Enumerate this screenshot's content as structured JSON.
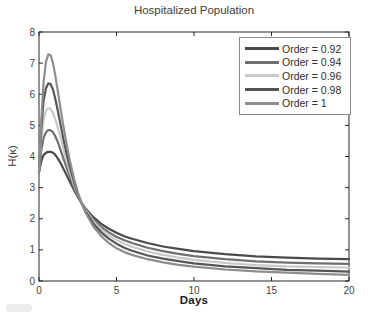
{
  "figure": {
    "background": "#ffffff",
    "axis_color": "#262626",
    "tick_label_color": "#454545"
  },
  "legend": {
    "border_color": "#8a8a8a",
    "background": "#ffffff",
    "position": "top-right"
  },
  "artifacts": {
    "bottom_left_smudge_color": "#dcdcdc"
  },
  "chart_data": {
    "type": "line",
    "title": "Hospitalized Population",
    "xlabel": "Days",
    "ylabel": "H(κ)",
    "xlim": [
      0,
      20
    ],
    "ylim": [
      0,
      8
    ],
    "xticks": [
      0,
      5,
      10,
      15,
      20
    ],
    "yticks": [
      0,
      1,
      2,
      3,
      4,
      5,
      6,
      7,
      8
    ],
    "grid": false,
    "legend_position": "top-right",
    "x": [
      0,
      0.15,
      0.3,
      0.45,
      0.6,
      0.75,
      0.9,
      1.05,
      1.2,
      1.4,
      1.6,
      1.8,
      2,
      2.25,
      2.5,
      2.75,
      3,
      3.5,
      4,
      4.5,
      5,
      5.5,
      6,
      7,
      8,
      9,
      10,
      12,
      14,
      16,
      18,
      20
    ],
    "series": [
      {
        "name": "Order = 0.92",
        "color": "#4a4a4a",
        "peak_value": 4.15,
        "peak_day": 0.8,
        "value_at_day20": 0.7,
        "values": [
          3.5,
          3.85,
          4.05,
          4.12,
          4.15,
          4.15,
          4.12,
          4.05,
          3.95,
          3.78,
          3.58,
          3.38,
          3.18,
          2.93,
          2.7,
          2.5,
          2.33,
          2.05,
          1.84,
          1.68,
          1.55,
          1.44,
          1.36,
          1.22,
          1.11,
          1.03,
          0.96,
          0.86,
          0.79,
          0.75,
          0.72,
          0.7
        ]
      },
      {
        "name": "Order = 0.94",
        "color": "#6f6f6f",
        "peak_value": 4.85,
        "peak_day": 0.75,
        "value_at_day20": 0.55,
        "values": [
          3.5,
          4.2,
          4.6,
          4.78,
          4.85,
          4.84,
          4.78,
          4.65,
          4.48,
          4.2,
          3.9,
          3.62,
          3.35,
          3.0,
          2.73,
          2.5,
          2.3,
          1.98,
          1.74,
          1.56,
          1.42,
          1.31,
          1.22,
          1.07,
          0.96,
          0.87,
          0.8,
          0.7,
          0.63,
          0.59,
          0.57,
          0.55
        ]
      },
      {
        "name": "Order = 0.96",
        "color": "#c9c9c9",
        "peak_value": 5.55,
        "peak_day": 0.7,
        "value_at_day20": 0.43,
        "values": [
          3.5,
          4.55,
          5.2,
          5.48,
          5.55,
          5.53,
          5.4,
          5.2,
          4.95,
          4.6,
          4.2,
          3.85,
          3.5,
          3.1,
          2.78,
          2.5,
          2.28,
          1.92,
          1.66,
          1.47,
          1.32,
          1.2,
          1.1,
          0.95,
          0.84,
          0.75,
          0.68,
          0.58,
          0.51,
          0.47,
          0.45,
          0.43
        ]
      },
      {
        "name": "Order = 0.98",
        "color": "#555555",
        "peak_value": 6.35,
        "peak_day": 0.65,
        "value_at_day20": 0.3,
        "values": [
          3.5,
          4.9,
          5.8,
          6.2,
          6.35,
          6.33,
          6.15,
          5.85,
          5.5,
          5.0,
          4.5,
          4.05,
          3.65,
          3.2,
          2.8,
          2.5,
          2.25,
          1.85,
          1.57,
          1.36,
          1.2,
          1.07,
          0.97,
          0.82,
          0.72,
          0.64,
          0.57,
          0.47,
          0.41,
          0.36,
          0.33,
          0.3
        ]
      },
      {
        "name": "Order = 1",
        "color": "#8d8d8d",
        "peak_value": 7.3,
        "peak_day": 0.6,
        "value_at_day20": 0.2,
        "values": [
          3.5,
          5.2,
          6.4,
          7.05,
          7.28,
          7.25,
          7.0,
          6.6,
          6.15,
          5.5,
          4.9,
          4.35,
          3.85,
          3.3,
          2.85,
          2.5,
          2.2,
          1.75,
          1.45,
          1.22,
          1.05,
          0.93,
          0.84,
          0.7,
          0.6,
          0.52,
          0.46,
          0.37,
          0.31,
          0.27,
          0.23,
          0.2
        ]
      }
    ]
  }
}
